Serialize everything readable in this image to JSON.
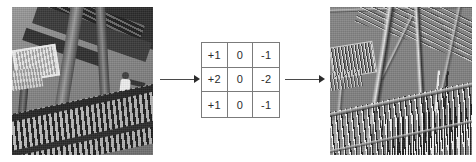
{
  "figure": {
    "background_color": "#ffffff"
  },
  "source_image": {
    "name": "source-photo",
    "alt": "Grayscale photograph of a metal staircase and railing viewed from below, with a person standing near the handrail",
    "description": "input image"
  },
  "kernel": {
    "name": "sobel-x-kernel",
    "rows": [
      [
        "+1",
        "0",
        "-1"
      ],
      [
        "+2",
        "0",
        "-2"
      ],
      [
        "+1",
        "0",
        "-1"
      ]
    ],
    "border_color": "#7b7b7b",
    "text_color": "#2b2b2b"
  },
  "arrows": {
    "first": {
      "name": "arrow-source-to-kernel",
      "glyph": "→"
    },
    "second": {
      "name": "arrow-kernel-to-result",
      "glyph": "→"
    }
  },
  "result_image": {
    "name": "result-photo",
    "alt": "Edge-detected version of the staircase photo: flat mid-gray field with thin bright and dark lines tracing vertical edges of the railing balusters, beams and stair treads",
    "description": "filtered output image",
    "base_gray": "#828282"
  }
}
